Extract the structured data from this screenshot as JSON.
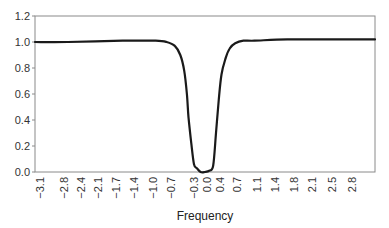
{
  "chart_data": {
    "type": "line",
    "title": "",
    "xlabel": "Frequency",
    "ylabel": "",
    "ylim": [
      0.0,
      1.2
    ],
    "yticks": [
      "0.0",
      "0.2",
      "0.4",
      "0.6",
      "0.8",
      "1.0",
      "1.2"
    ],
    "xticks": [
      "−3.1",
      "−2.8",
      "−2.4",
      "−2.1",
      "−1.7",
      "−1.4",
      "−1.0",
      "−0.7",
      "−0.3",
      "0.0",
      "0.4",
      "0.7",
      "1.1",
      "1.4",
      "1.8",
      "2.1",
      "2.5",
      "2.8"
    ],
    "grid": false,
    "legend": null,
    "series": [
      {
        "name": "response",
        "color": "#1a1a1a",
        "x": [
          -3.1,
          -2.5,
          -1.5,
          -0.9,
          -0.7,
          -0.55,
          -0.45,
          -0.38,
          -0.33,
          -0.3,
          -0.25,
          -0.2,
          -0.15,
          -0.08,
          0.0,
          0.08,
          0.15,
          0.2,
          0.25,
          0.3,
          0.38,
          0.45,
          0.55,
          0.7,
          0.9,
          1.5,
          2.5,
          3.1
        ],
        "values": [
          1.0,
          1.0,
          1.01,
          1.01,
          1.0,
          0.97,
          0.9,
          0.78,
          0.6,
          0.42,
          0.22,
          0.06,
          0.03,
          0.0,
          0.0,
          0.01,
          0.05,
          0.3,
          0.55,
          0.75,
          0.88,
          0.95,
          0.99,
          1.01,
          1.01,
          1.02,
          1.02,
          1.02
        ]
      }
    ]
  }
}
